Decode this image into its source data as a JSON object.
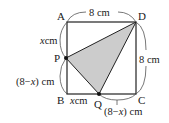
{
  "figure": {
    "shape": "square ABCD with shaded triangle PQD",
    "side_length": "8 cm",
    "colors": {
      "stroke": "#222222",
      "shading": "#cccccc",
      "dimension_arc": "#555555"
    },
    "vertices": {
      "A": "A",
      "B": "B",
      "C": "C",
      "D": "D",
      "P": "P",
      "Q": "Q"
    },
    "dimensions": {
      "top": "8 cm",
      "right": "8 cm",
      "AP_var": "x",
      "AP_unit": "cm",
      "PB_open": "(8−",
      "PB_var": "x",
      "PB_close": ") cm",
      "BQ_var": "x",
      "BQ_unit": "cm",
      "QC_open": "(8−",
      "QC_var": "x",
      "QC_close": ") cm"
    }
  }
}
